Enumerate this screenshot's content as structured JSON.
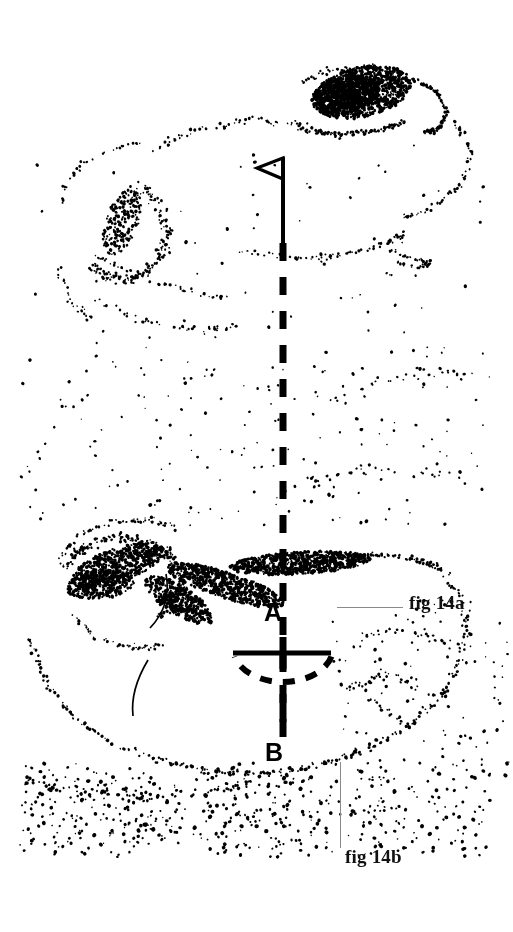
{
  "figure": {
    "title": "fig 14",
    "type": "stippled anatomical cross-section diagram",
    "background_color": "#ffffff",
    "ink_color": "#000000",
    "leader_line_color": "#8a8a8a",
    "width": 513,
    "height": 932
  },
  "callouts": [
    {
      "id": "fig-14a",
      "label": "fig 14a",
      "leader": "horizontal",
      "points_to": "section plane A"
    },
    {
      "id": "fig-14b",
      "label": "fig 14b",
      "leader": "vertical",
      "points_to": "section plane B"
    }
  ],
  "markers": {
    "point_a": "A",
    "point_b": "B",
    "flag": "flag-marker"
  },
  "chart_data": {
    "type": "scatter",
    "title": "fig 14",
    "xlabel": "",
    "ylabel": "",
    "xlim": [
      0,
      513
    ],
    "ylim": [
      0,
      932
    ],
    "grid": false,
    "legend": false,
    "annotations": [
      {
        "text": "A",
        "x": 272,
        "y": 613
      },
      {
        "text": "B",
        "x": 273,
        "y": 753
      },
      {
        "text": "fig 14a",
        "x": 409,
        "y": 602
      },
      {
        "text": "fig 14b",
        "x": 345,
        "y": 856
      }
    ],
    "overlays": {
      "flag_marker": {
        "pole_x": 283,
        "pole_top": 157,
        "pole_bottom": 243,
        "flag_width": 26,
        "flag_height": 22,
        "direction": "left"
      },
      "axis_dashed_line": {
        "x": 283,
        "y_top": 243,
        "y_bottom": 745,
        "dash": 18,
        "gap": 16,
        "width": 7
      },
      "plane_a_line": {
        "x1": 233,
        "x2": 331,
        "y": 653,
        "width": 5
      },
      "plane_a_arc": {
        "cx": 283,
        "cy": 648,
        "rx": 50,
        "ry": 34,
        "dashed": true
      },
      "tick_a": {
        "x": 283,
        "y1": 637,
        "y2": 672
      },
      "tick_b": {
        "x": 283,
        "y1": 694,
        "y2": 722
      }
    },
    "stipple_clusters": [
      {
        "name": "upper-section-dense-lobe",
        "cx": 365,
        "cy": 92,
        "rx": 52,
        "ry": 26,
        "density": "high"
      },
      {
        "name": "upper-section-outer-rim",
        "cx": 255,
        "cy": 185,
        "rx": 185,
        "ry": 110,
        "density": "low"
      },
      {
        "name": "upper-section-left-lobe",
        "cx": 120,
        "cy": 235,
        "rx": 55,
        "ry": 52,
        "density": "medium"
      },
      {
        "name": "lower-section-dense-band",
        "cx": 300,
        "cy": 565,
        "rx": 120,
        "ry": 22,
        "density": "high"
      },
      {
        "name": "lower-section-left-lobe",
        "cx": 120,
        "cy": 570,
        "rx": 62,
        "ry": 38,
        "density": "high"
      },
      {
        "name": "lower-section-outer-rim",
        "cx": 250,
        "cy": 660,
        "rx": 200,
        "ry": 115,
        "density": "low"
      },
      {
        "name": "lower-section-base-field",
        "cx": 230,
        "cy": 800,
        "rx": 215,
        "ry": 55,
        "density": "medium"
      }
    ]
  }
}
